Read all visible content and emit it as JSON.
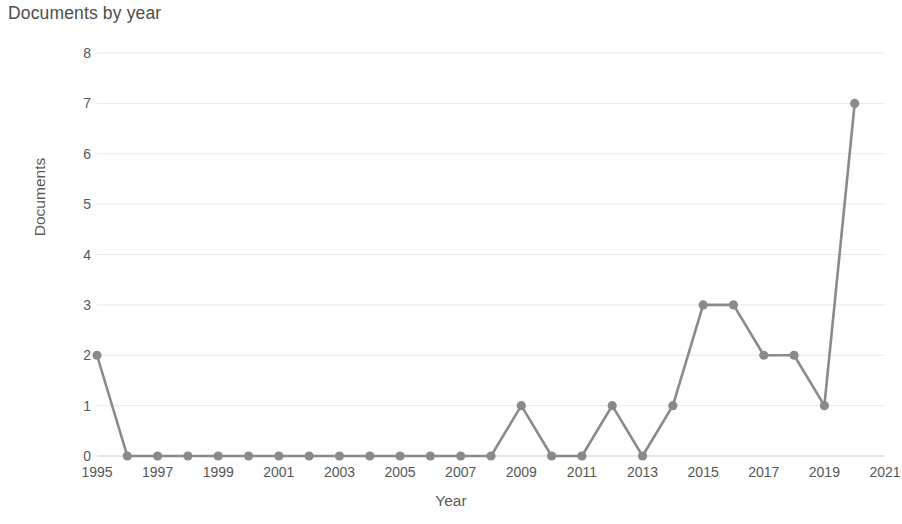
{
  "chart_data": {
    "type": "line",
    "title": "Documents by year",
    "xlabel": "Year",
    "ylabel": "Documents",
    "x": [
      1995,
      1996,
      1997,
      1998,
      1999,
      2000,
      2001,
      2002,
      2003,
      2004,
      2005,
      2006,
      2007,
      2008,
      2009,
      2010,
      2011,
      2012,
      2013,
      2014,
      2015,
      2016,
      2017,
      2018,
      2019,
      2020
    ],
    "values": [
      2,
      0,
      0,
      0,
      0,
      0,
      0,
      0,
      0,
      0,
      0,
      0,
      0,
      0,
      1,
      0,
      0,
      1,
      0,
      1,
      3,
      3,
      2,
      2,
      1,
      7
    ],
    "series": [
      {
        "name": "Documents",
        "values": [
          2,
          0,
          0,
          0,
          0,
          0,
          0,
          0,
          0,
          0,
          0,
          0,
          0,
          0,
          1,
          0,
          0,
          1,
          0,
          1,
          3,
          3,
          2,
          2,
          1,
          7
        ]
      }
    ],
    "xlim": [
      1995,
      2021
    ],
    "ylim": [
      0,
      8
    ],
    "ytick_labels": [
      "0",
      "1",
      "2",
      "3",
      "4",
      "5",
      "6",
      "7",
      "8"
    ],
    "ytick_values": [
      0,
      1,
      2,
      3,
      4,
      5,
      6,
      7,
      8
    ],
    "xtick_labels": [
      "1995",
      "1997",
      "1999",
      "2001",
      "2003",
      "2005",
      "2007",
      "2009",
      "2011",
      "2013",
      "2015",
      "2017",
      "2019",
      "2021"
    ],
    "xtick_values": [
      1995,
      1997,
      1999,
      2001,
      2003,
      2005,
      2007,
      2009,
      2011,
      2013,
      2015,
      2017,
      2019,
      2021
    ],
    "grid": true,
    "legend": false,
    "marker": "circle",
    "line_color": "#8a8a8a",
    "marker_color": "#8a8a8a",
    "grid_color": "#e9e9e9",
    "background_color": "#ffffff"
  }
}
